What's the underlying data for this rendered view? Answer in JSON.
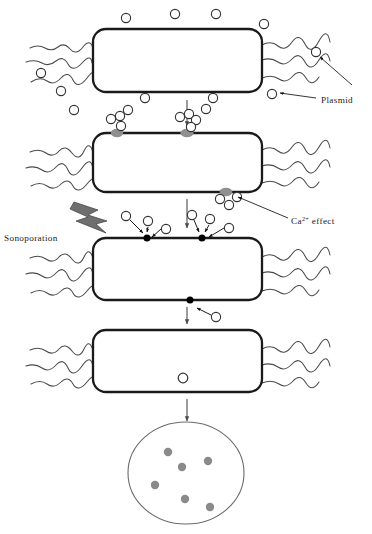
{
  "figure": {
    "width": 372,
    "height": 534,
    "background_color": "#ffffff"
  },
  "colors": {
    "outline": "#1a1a1a",
    "membrane": "#1a1a1a",
    "plasmid_fill": "#ffffff",
    "plasmid_stroke": "#333333",
    "calcium_blob": "#8f8f8f",
    "pore_fill": "#000000",
    "lightning_fill": "#6e6e6e",
    "lightning_stroke": "#3d3d3d",
    "colony_fill": "#8a8a8a",
    "dish_stroke": "#6b6b6b",
    "caption_faint": "#c9c9c9",
    "text": "#1a1a1a"
  },
  "labels": [
    {
      "id": "plasmid",
      "text": "Plasmid",
      "x": 321,
      "y": 100,
      "anchor": "start",
      "superscript": ""
    },
    {
      "id": "ca-effect",
      "text": "Ca",
      "superscript": "2+",
      "suffix": " effect",
      "x": 291,
      "y": 222,
      "anchor": "start"
    },
    {
      "id": "sonoporation",
      "text": "Sonoporation",
      "x": 4,
      "y": 238,
      "anchor": "start",
      "superscript": ""
    }
  ],
  "caption": {
    "text": "Transformed colonies on plate",
    "visible_fragment": "",
    "x": 186,
    "y": 530
  },
  "stages": [
    {
      "id": "stage-1",
      "name": "untreated-cell-with-free-plasmids",
      "cell": {
        "x": 93,
        "y": 29,
        "width": 169,
        "height": 63,
        "radius": 13
      },
      "description": "Bacterial cell surrounded by free plasmids"
    },
    {
      "id": "stage-2",
      "name": "calcium-mediated-plasmid-adsorption",
      "cell": {
        "x": 93,
        "y": 133,
        "width": 169,
        "height": 59,
        "radius": 13
      },
      "description": "Plasmids aggregate at membrane via Ca2+ effect"
    },
    {
      "id": "stage-3",
      "name": "sonoporation-pore-formation",
      "cell": {
        "x": 93,
        "y": 238,
        "width": 169,
        "height": 62,
        "radius": 13
      },
      "description": "Ultrasound creates transient pores; plasmids enter"
    },
    {
      "id": "stage-4",
      "name": "transformed-cell-with-internal-plasmid",
      "cell": {
        "x": 93,
        "y": 330,
        "width": 169,
        "height": 62,
        "radius": 13
      },
      "description": "Plasmid internalised inside the cell"
    },
    {
      "id": "stage-5",
      "name": "colony-plate",
      "dish": {
        "cx": 186,
        "cy": 473,
        "rx": 58,
        "ry": 51
      },
      "description": "Petri dish showing transformed colonies"
    }
  ],
  "plasmids": {
    "radius": 4.6,
    "stage1_free": [
      {
        "x": 126,
        "y": 18
      },
      {
        "x": 175,
        "y": 14
      },
      {
        "x": 216,
        "y": 14
      },
      {
        "x": 264,
        "y": 24
      },
      {
        "x": 41,
        "y": 73
      },
      {
        "x": 61,
        "y": 91
      },
      {
        "x": 145,
        "y": 98
      },
      {
        "x": 213,
        "y": 98
      },
      {
        "x": 316,
        "y": 52
      },
      {
        "x": 272,
        "y": 94
      }
    ],
    "stage2_clusters": [
      {
        "anchor_x": 117,
        "anchor_y": 133,
        "members": [
          {
            "dx": -6,
            "dy": -14
          },
          {
            "dx": 3,
            "dy": -17
          },
          {
            "dx": 4,
            "dy": -8
          }
        ]
      },
      {
        "anchor_x": 186,
        "anchor_y": 133,
        "members": [
          {
            "dx": -7,
            "dy": -16
          },
          {
            "dx": 2,
            "dy": -19
          },
          {
            "dx": 9,
            "dy": -13
          },
          {
            "dx": 4,
            "dy": -6
          }
        ]
      },
      {
        "anchor_x": 225,
        "anchor_y": 192,
        "members": [
          {
            "dx": -6,
            "dy": 7
          },
          {
            "dx": 3,
            "dy": 13
          },
          {
            "dx": 11,
            "dy": 5
          }
        ]
      }
    ],
    "stage2_free": [
      {
        "x": 74,
        "y": 110
      },
      {
        "x": 128,
        "y": 110
      },
      {
        "x": 206,
        "y": 109
      }
    ],
    "stage3_entering": [
      {
        "x": 128,
        "y": 215
      },
      {
        "x": 151,
        "y": 220
      },
      {
        "x": 167,
        "y": 227
      },
      {
        "x": 194,
        "y": 214
      },
      {
        "x": 211,
        "y": 219
      },
      {
        "x": 230,
        "y": 228
      },
      {
        "x": 216,
        "y": 317
      }
    ],
    "stage4_internal": [
      {
        "x": 183,
        "y": 378
      }
    ]
  },
  "pores": [
    {
      "x": 147,
      "y": 238,
      "r": 3.4
    },
    {
      "x": 202,
      "y": 238,
      "r": 3.4
    },
    {
      "x": 190,
      "y": 300,
      "r": 3.4
    }
  ],
  "colonies": [
    {
      "x": 168,
      "y": 452,
      "r": 4.2
    },
    {
      "x": 182,
      "y": 467,
      "r": 4.2
    },
    {
      "x": 208,
      "y": 461,
      "r": 4.2
    },
    {
      "x": 155,
      "y": 485,
      "r": 4.2
    },
    {
      "x": 185,
      "y": 499,
      "r": 4.2
    },
    {
      "x": 210,
      "y": 507,
      "r": 4.2
    }
  ],
  "flow_arrows": [
    {
      "id": "arrow-1-2",
      "x": 187,
      "y1": 100,
      "y2": 126
    },
    {
      "id": "arrow-2-3",
      "x": 187,
      "y1": 199,
      "y2": 228
    },
    {
      "id": "arrow-3-4",
      "x": 187,
      "y1": 307,
      "y2": 324
    },
    {
      "id": "arrow-4-plate",
      "x": 187,
      "y1": 399,
      "y2": 421
    }
  ],
  "leader_lines": [
    {
      "id": "plasmid-leader-upper",
      "from": [
        316,
        56
      ],
      "to": [
        352,
        84
      ]
    },
    {
      "id": "plasmid-leader-lower",
      "from": [
        316,
        97
      ],
      "to": [
        279,
        92
      ]
    },
    {
      "id": "ca-leader",
      "from": [
        288,
        219
      ],
      "to": [
        236,
        196
      ]
    }
  ],
  "lightning": {
    "id": "sonoporation-bolt",
    "points": "76,203 98,211 90,216 106,222 97,224 104,232 78,221 87,217 72,210"
  }
}
